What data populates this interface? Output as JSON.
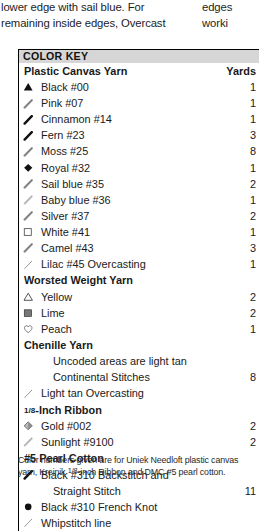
{
  "body_text": {
    "left_lines": [
      "lower edge with sail blue. For",
      "remaining inside edges, Overcast"
    ],
    "right_lines": [
      "edges",
      "worki"
    ]
  },
  "color_key": {
    "title": "COLOR KEY",
    "yards_header": "Yards",
    "sections": [
      {
        "name": "Plastic Canvas Yarn",
        "entries": [
          {
            "symbol": "filled-triangle",
            "label": "Black #00",
            "yards": "1"
          },
          {
            "symbol": "hatched-slash-light",
            "label": "Pink #07",
            "yards": "1"
          },
          {
            "symbol": "hatched-slash-dark",
            "label": "Cinnamon #14",
            "yards": "1"
          },
          {
            "symbol": "hatched-slash-dark",
            "label": "Fern #23",
            "yards": "3"
          },
          {
            "symbol": "hatched-slash-light",
            "label": "Moss #25",
            "yards": "8"
          },
          {
            "symbol": "filled-diamond",
            "label": "Royal #32",
            "yards": "1"
          },
          {
            "symbol": "hatched-slash-light",
            "label": "Sail blue #35",
            "yards": "2"
          },
          {
            "symbol": "hatched-slash-vlight",
            "label": "Baby blue #36",
            "yards": "1"
          },
          {
            "symbol": "hatched-slash-light",
            "label": "Silver #37",
            "yards": "2"
          },
          {
            "symbol": "open-square",
            "label": "White #41",
            "yards": "1"
          },
          {
            "symbol": "hatched-slash-light",
            "label": "Camel #43",
            "yards": "3"
          },
          {
            "symbol": "thin-stroke",
            "label": "Lilac #45 Overcasting",
            "yards": "1"
          }
        ]
      },
      {
        "name": "Worsted Weight Yarn",
        "entries": [
          {
            "symbol": "open-triangle",
            "label": "Yellow",
            "yards": "2"
          },
          {
            "symbol": "filled-square",
            "label": "Lime",
            "yards": "2"
          },
          {
            "symbol": "open-heart",
            "label": "Peach",
            "yards": "1"
          }
        ]
      },
      {
        "name": "Chenille Yarn",
        "entries": [
          {
            "symbol": "none",
            "label": "Uncoded areas are light tan",
            "yards": "",
            "indent": true
          },
          {
            "symbol": "none",
            "label": "Continental Stitches",
            "yards": "8",
            "indent": true
          },
          {
            "symbol": "thin-stroke",
            "label": "Light tan Overcasting",
            "yards": ""
          }
        ]
      },
      {
        "name": "⅙-Inch Ribbon",
        "name_is_fraction": true,
        "fraction_num": "1",
        "fraction_den": "8",
        "name_rest": "-Inch Ribbon",
        "entries": [
          {
            "symbol": "shaded-diamond",
            "label": "Gold #002",
            "yards": "2"
          },
          {
            "symbol": "hatched-slash-vlight",
            "label": "Sunlight #9100",
            "yards": "2"
          }
        ]
      },
      {
        "name": "#5 Pearl Cotton",
        "entries": [
          {
            "symbol": "hatched-slash-dark",
            "label": "Black #310 Backstitch and",
            "yards": ""
          },
          {
            "symbol": "none",
            "label": "Straight Stitch",
            "yards": "11",
            "indent": true
          },
          {
            "symbol": "filled-circle",
            "label": "Black #310 French Knot",
            "yards": ""
          },
          {
            "symbol": "thin-stroke",
            "label": "Whipstitch line",
            "yards": ""
          }
        ]
      }
    ],
    "footnote_lines": [
      "Color numbers given are for Uniek Needloft plastic canvas",
      "yarn, Kreinik ⅛-inch Ribbon and DMC #5 pearl cotton."
    ],
    "footnote_line2_pre": "yarn, Kreinik ",
    "footnote_line2_num": "1",
    "footnote_line2_den": "8",
    "footnote_line2_post": "-inch Ribbon and DMC #5 pearl cotton."
  },
  "colors": {
    "header_band": "#d6d6d6",
    "border": "#000000",
    "text": "#1a1a1a"
  }
}
